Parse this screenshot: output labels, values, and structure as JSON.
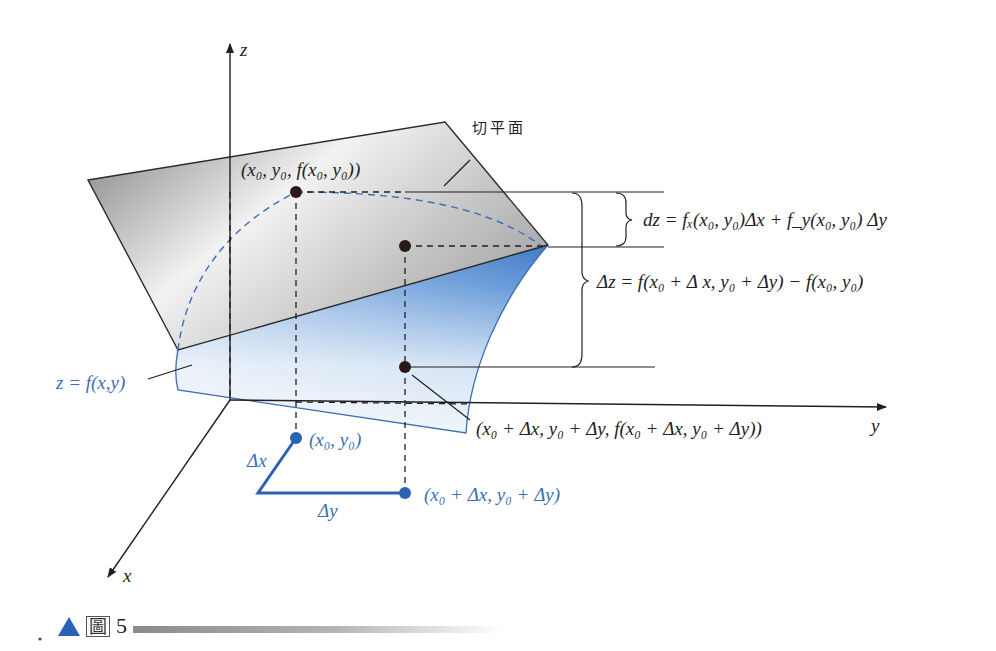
{
  "figure": {
    "axes": {
      "x_label": "x",
      "y_label": "y",
      "z_label": "z"
    },
    "tangent_plane_label": "切平面",
    "point_p0_label": "(x₀, y₀, f(x₀, y₀))",
    "surface_label": "z = f(x,y)",
    "point_p1_label": "(x₀ + Δx, y₀ + Δy, f(x₀ + Δx, y₀ + Δy))",
    "dz_formula": "dz = fₓ(x₀, y₀)Δx + f_y(x₀, y₀) Δy",
    "delta_z_formula": "Δz = f(x₀ + Δ x, y₀ + Δy) − f(x₀, y₀)",
    "projection_p0_label": "(x₀, y₀)",
    "projection_p1_label": "(x₀ + Δx, y₀ + Δy)",
    "delta_x_label": "Δx",
    "delta_y_label": "Δy",
    "colors": {
      "accent_blue": "#2a63b5",
      "label_blue": "#3a6fb5",
      "plane_gray": "#9a9a9a",
      "ink": "#231f20"
    }
  },
  "caption": {
    "prefix": "圖",
    "number": "5"
  }
}
